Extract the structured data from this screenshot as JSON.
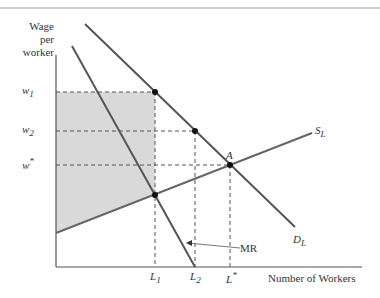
{
  "figure": {
    "y_axis_label": [
      "Wage",
      "per",
      "worker"
    ],
    "x_axis_label": "Number of Workers",
    "y_ticks": [
      {
        "label": "w",
        "sub": "1",
        "y": 92
      },
      {
        "label": "w",
        "sub": "2",
        "y": 131
      },
      {
        "label": "w",
        "sub": "*",
        "y": 165
      }
    ],
    "x_ticks": [
      {
        "label": "L",
        "sub": "1",
        "x": 155
      },
      {
        "label": "L",
        "sub": "2",
        "x": 195
      },
      {
        "label": "L",
        "sub": "*",
        "x": 230
      }
    ],
    "curves": [
      {
        "name": "S_L",
        "label": "S",
        "sub": "L"
      },
      {
        "name": "D_L",
        "label": "D",
        "sub": "L"
      },
      {
        "name": "MR",
        "label": "MR"
      }
    ],
    "point_label": "A",
    "colors": {
      "line": "#555555",
      "shade": "#d9d9d9",
      "dash": "#555555",
      "border": "#bbbbbb"
    }
  }
}
